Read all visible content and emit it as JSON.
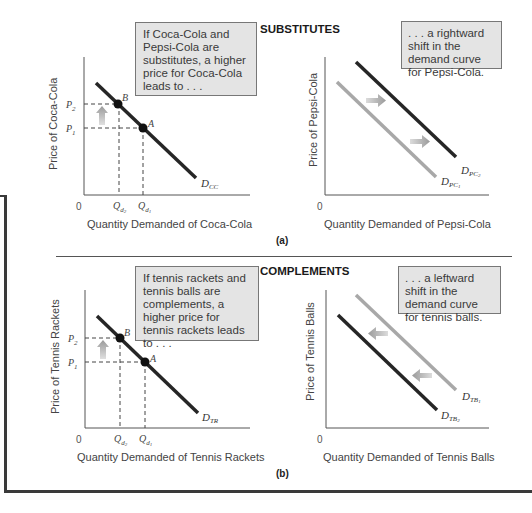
{
  "panels": {
    "a": {
      "label": "(a)",
      "title": "SUBSTITUTES",
      "left": {
        "callout": "If Coca-Cola and Pepsi-Cola are substitutes, a higher price for Coca-Cola leads to . . .",
        "y_label": "Price of Coca-Cola",
        "x_label": "Quantity Demanded of Coca-Cola",
        "origin": "0",
        "p2": "P",
        "p2_sub": "2",
        "p1": "P",
        "p1_sub": "1",
        "q2": "Q",
        "q2_sub": "d",
        "q2_subsub": "2",
        "q1": "Q",
        "q1_sub": "d",
        "q1_subsub": "1",
        "point_b": "B",
        "point_a": "A",
        "curve": "D",
        "curve_sub": "CC"
      },
      "right": {
        "callout": ". . . a rightward shift in the demand curve for Pepsi-Cola.",
        "y_label": "Price of Pepsi-Cola",
        "x_label": "Quantity Demanded of Pepsi-Cola",
        "origin": "0",
        "curve_new": "D",
        "curve_new_sub": "PC",
        "curve_new_subsub": "2",
        "curve_old": "D",
        "curve_old_sub": "PC",
        "curve_old_subsub": "1"
      }
    },
    "b": {
      "label": "(b)",
      "title": "COMPLEMENTS",
      "left": {
        "callout": "If tennis rackets and tennis balls are complements, a higher price for tennis rackets leads to . . .",
        "y_label": "Price of Tennis Rackets",
        "x_label": "Quantity Demanded of Tennis Rackets",
        "origin": "0",
        "p2": "P",
        "p2_sub": "2",
        "p1": "P",
        "p1_sub": "1",
        "q2": "Q",
        "q2_sub": "d",
        "q2_subsub": "2",
        "q1": "Q",
        "q1_sub": "d",
        "q1_subsub": "1",
        "point_b": "B",
        "point_a": "A",
        "curve": "D",
        "curve_sub": "TR"
      },
      "right": {
        "callout": ". . . a leftward shift in the demand curve for tennis balls.",
        "y_label": "Price of Tennis Balls",
        "x_label": "Quantity Demanded of Tennis Balls",
        "origin": "0",
        "curve_old": "D",
        "curve_old_sub": "TB",
        "curve_old_subsub": "1",
        "curve_new": "D",
        "curve_new_sub": "TB",
        "curve_new_subsub": "2"
      }
    }
  },
  "colors": {
    "dark_curve": "#262626",
    "light_curve": "#a8a8a8",
    "callout_bg": "#e4e4e4",
    "arrow": "#b0b0b0"
  }
}
